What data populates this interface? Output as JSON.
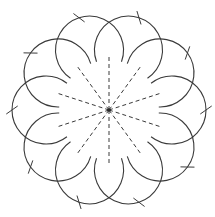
{
  "diagram": {
    "title": "",
    "background": "#ffffff",
    "stroke_color": "#3a3a3a",
    "center": [
      109,
      110
    ],
    "rays": {
      "count": 10,
      "start_angle_deg": 90,
      "step_deg": 36,
      "length": 55,
      "style": "dashed"
    },
    "petal_arcs": {
      "count": 10,
      "center_offset_angle_deg": 0,
      "step_deg": 36,
      "center_radius": 63,
      "arc_radius": 34,
      "half_span_deg": 128
    },
    "ticks": {
      "count": 10,
      "radius": 97,
      "length": 14,
      "tilt_deg": 35
    }
  }
}
